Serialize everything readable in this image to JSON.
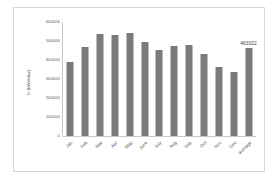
{
  "chart_data": {
    "type": "bar",
    "title": "",
    "xlabel": "",
    "ylabel": "U (kWh/day)",
    "ylim": [
      0,
      600000
    ],
    "grid": false,
    "legend": "none",
    "categories": [
      "Jan",
      "Feb",
      "Mar",
      "Apr",
      "May",
      "June",
      "July",
      "Aug",
      "Sep",
      "Oct",
      "Nov",
      "Dec",
      "average"
    ],
    "values": [
      390000,
      468000,
      537000,
      533000,
      541000,
      493000,
      451000,
      476000,
      478000,
      432000,
      365000,
      339000,
      463322
    ],
    "y_tick_labels": [
      "600000",
      "500000",
      "400000",
      "300000",
      "200000",
      "100000",
      "0"
    ],
    "y_tick_values": [
      600000,
      500000,
      400000,
      300000,
      200000,
      100000,
      0
    ],
    "annotations": [
      {
        "text": "463322",
        "category": "average",
        "value": 463322
      }
    ],
    "series_color": "#7b7b7b"
  }
}
